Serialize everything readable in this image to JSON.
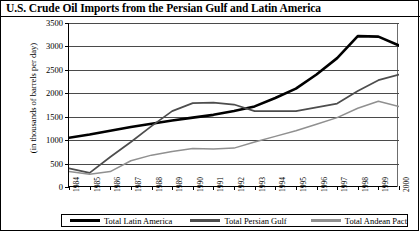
{
  "title": "U.S. Crude Oil Imports from the Persian Gulf and Latin America",
  "axis": {
    "ylabel": "(in thousands of barrels per day)",
    "yticks": [
      "0",
      "500",
      "1000",
      "1500",
      "2000",
      "2500",
      "3000",
      "3500"
    ],
    "xticks": [
      "1984",
      "1985",
      "1986",
      "1987",
      "1988",
      "1989",
      "1990",
      "1991",
      "1992",
      "1993",
      "1994",
      "1995",
      "1996",
      "1997",
      "1998",
      "1999",
      "2000"
    ]
  },
  "legend": {
    "items": [
      {
        "label": "Total Latin America",
        "color": "#000000"
      },
      {
        "label": "Total Persian Gulf",
        "color": "#4d4d4d"
      },
      {
        "label": "Total Andean Pact",
        "color": "#909090"
      }
    ]
  },
  "chart_data": {
    "type": "line",
    "title": "U.S. Crude Oil Imports from the Persian Gulf and Latin America",
    "xlabel": "",
    "ylabel": "(in thousands of barrels per day)",
    "ylim": [
      0,
      3500
    ],
    "ytick_step": 500,
    "grid": true,
    "legend_position": "bottom",
    "x": [
      1984,
      1985,
      1986,
      1987,
      1988,
      1989,
      1990,
      1991,
      1992,
      1993,
      1994,
      1995,
      1996,
      1997,
      1998,
      1999,
      2000
    ],
    "series": [
      {
        "name": "Total Latin America",
        "color": "#000000",
        "values": [
          1050,
          1120,
          1200,
          1280,
          1350,
          1420,
          1480,
          1540,
          1620,
          1720,
          1900,
          2100,
          2400,
          2750,
          3220,
          3210,
          3020
        ]
      },
      {
        "name": "Total Persian Gulf",
        "color": "#4d4d4d",
        "values": [
          400,
          300,
          640,
          960,
          1300,
          1620,
          1790,
          1800,
          1760,
          1620,
          1620,
          1620,
          1700,
          1780,
          2050,
          2280,
          2400
        ]
      },
      {
        "name": "Total Andean Pact",
        "color": "#909090",
        "values": [
          330,
          270,
          330,
          560,
          680,
          760,
          820,
          810,
          830,
          960,
          1080,
          1200,
          1340,
          1480,
          1680,
          1830,
          1720
        ]
      }
    ]
  }
}
